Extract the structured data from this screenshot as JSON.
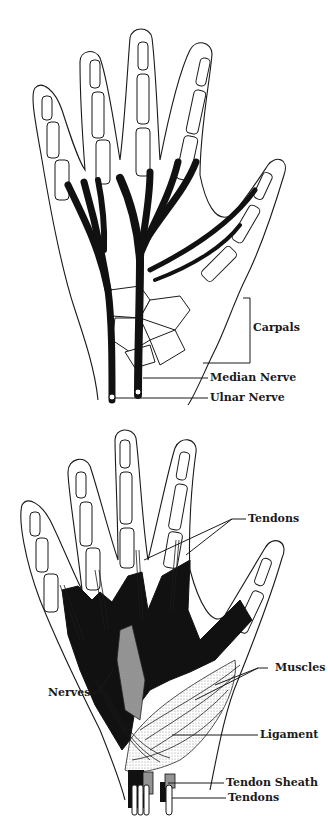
{
  "figures": [
    {
      "id": "hand-nerves",
      "labels": {
        "carpals": "Carpals",
        "median_nerve": "Median Nerve",
        "ulnar_nerve": "Ulnar Nerve"
      }
    },
    {
      "id": "hand-tendons-muscles",
      "labels": {
        "tendons_top": "Tendons",
        "muscles": "Muscles",
        "ligament": "Ligament",
        "nerves": "Nerves",
        "tendon_sheath": "Tendon Sheath",
        "tendons_bottom": "Tendons"
      }
    }
  ],
  "colors": {
    "ink": "#1a1a1a",
    "background": "#ffffff",
    "stipple": "#bdbdbd"
  }
}
